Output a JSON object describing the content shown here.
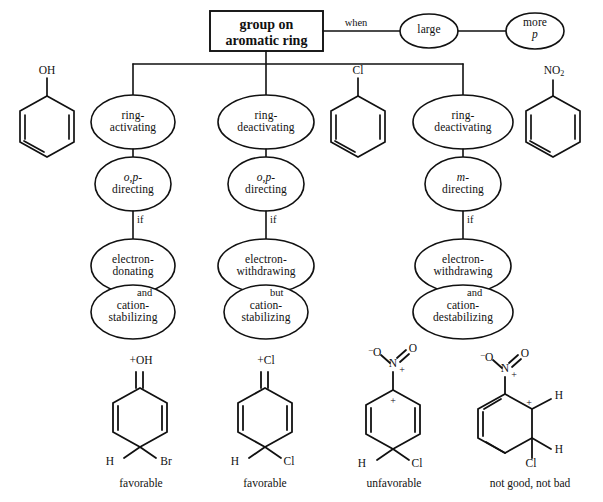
{
  "figure": {
    "title_box": {
      "line1": "group on",
      "line2": "aromatic ring"
    },
    "top_edges": [
      {
        "label": "when"
      }
    ],
    "top_nodes": [
      {
        "name": "large",
        "line1": "large",
        "line2": ""
      },
      {
        "name": "more-p",
        "line1": "more",
        "line2": "p",
        "line2_italic": true
      }
    ],
    "branches": [
      {
        "id": "branch-1",
        "molecule": {
          "name": "phenol",
          "substituent": "OH"
        },
        "nodes": [
          {
            "line1": "ring-",
            "line2": "activating"
          },
          {
            "line1": "o,p-",
            "line2": "directing",
            "line1_italic": true
          },
          {
            "line1": "electron-",
            "line2": "donating"
          },
          {
            "line1": "cation-",
            "line2": "stabilizing"
          }
        ],
        "connectors": [
          "",
          "if",
          "and"
        ],
        "product": {
          "top_label": "+OH",
          "bottom_left": "H",
          "bottom_right": "Br",
          "caption": "favorable"
        }
      },
      {
        "id": "branch-2",
        "molecule": {
          "name": "chlorobenzene",
          "substituent": "Cl"
        },
        "nodes": [
          {
            "line1": "ring-",
            "line2": "deactivating"
          },
          {
            "line1": "o,p-",
            "line2": "directing",
            "line1_italic": true
          },
          {
            "line1": "electron-",
            "line2": "withdrawing"
          },
          {
            "line1": "cation-",
            "line2": "stabilizing"
          }
        ],
        "connectors": [
          "",
          "if",
          "but"
        ],
        "product": {
          "top_label": "+Cl",
          "bottom_left": "H",
          "bottom_right": "Cl",
          "caption": "favorable"
        }
      },
      {
        "id": "branch-3",
        "molecule": {
          "name": "nitrobenzene",
          "substituent": "NO2"
        },
        "nodes": [
          {
            "line1": "ring-",
            "line2": "deactivating"
          },
          {
            "line1": "m-",
            "line2": "directing",
            "line1_italic": true
          },
          {
            "line1": "electron-",
            "line2": "withdrawing"
          },
          {
            "line1": "cation-",
            "line2": "destabilizing"
          }
        ],
        "connectors": [
          "",
          "if",
          "and"
        ],
        "product": {
          "top_label": "nitro",
          "ring_charge": "+",
          "bottom_left": "H",
          "bottom_right": "Cl",
          "caption": "unfavorable"
        }
      }
    ],
    "extra_product": {
      "id": "product-4",
      "top_label": "nitro",
      "ring_charge": "+",
      "right_top": "H",
      "right_bottom": "H",
      "bottom_left": "Cl",
      "caption": "not good, not bad"
    },
    "atoms": {
      "O": "O",
      "N": "N",
      "H": "H",
      "Cl": "Cl",
      "Br": "Br",
      "OH": "OH",
      "minus": "–",
      "plus": "+"
    },
    "colors": {
      "stroke": "#111111",
      "background": "#ffffff"
    }
  }
}
